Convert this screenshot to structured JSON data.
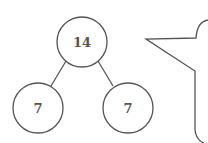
{
  "tree": {
    "root": {
      "value": "14"
    },
    "left": {
      "value": "7"
    },
    "right": {
      "value": "7"
    }
  },
  "colors": {
    "stroke": "#555555",
    "text": "#555555",
    "background": "#ffffff"
  }
}
